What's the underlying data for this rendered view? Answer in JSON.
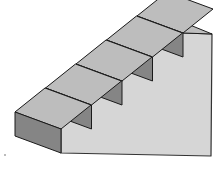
{
  "figure": {
    "step_count": 5,
    "colors": {
      "riser": "#858585",
      "tread": "#bdbdbd",
      "side": "#d6d6d6",
      "outline": "#1a1a1a",
      "background": "#ffffff"
    }
  }
}
